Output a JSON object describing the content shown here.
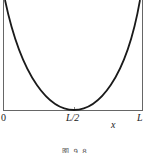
{
  "figure": {
    "caption": "图 9.8",
    "axis": {
      "x_label": "x",
      "ticks": [
        "0",
        "L/2",
        "L"
      ]
    },
    "curve": {
      "shape": "U-shaped (cosh-like) curve with minimum touching axis at L/2",
      "color": "#1a1a1a"
    },
    "frame_color": "#555555"
  }
}
